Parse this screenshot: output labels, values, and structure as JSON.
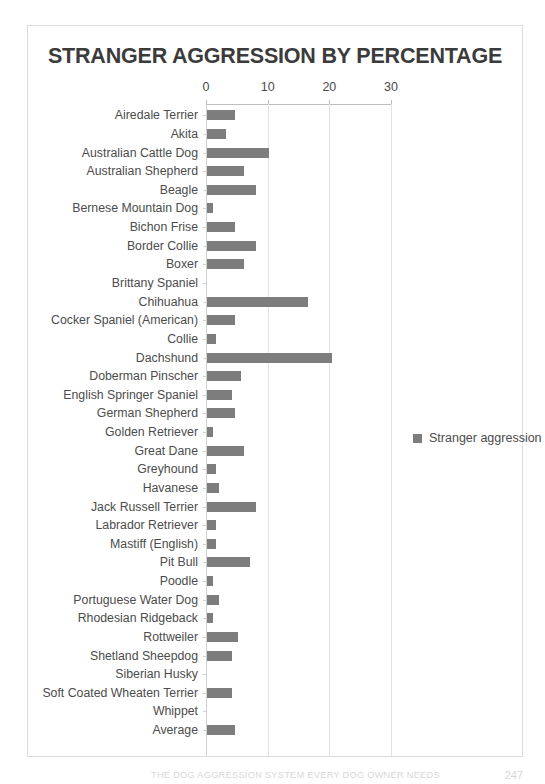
{
  "chart_data": {
    "type": "bar",
    "orientation": "horizontal",
    "title": "STRANGER AGGRESSION BY PERCENTAGE",
    "xlabel": "",
    "ylabel": "",
    "xlim": [
      0,
      30
    ],
    "xticks": [
      0,
      10,
      20,
      30
    ],
    "grid": true,
    "legend_position": "right",
    "series_name": "Stranger aggression",
    "bar_color": "#7d7d7d",
    "categories": [
      "Airedale Terrier",
      "Akita",
      "Australian Cattle Dog",
      "Australian Shepherd",
      "Beagle",
      "Bernese Mountain Dog",
      "Bichon Frise",
      "Border Collie",
      "Boxer",
      "Brittany Spaniel",
      "Chihuahua",
      "Cocker Spaniel (American)",
      "Collie",
      "Dachshund",
      "Doberman Pinscher",
      "English Springer Spaniel",
      "German Shepherd",
      "Golden Retriever",
      "Great Dane",
      "Greyhound",
      "Havanese",
      "Jack Russell Terrier",
      "Labrador Retriever",
      "Mastiff (English)",
      "Pit Bull",
      "Poodle",
      "Portuguese Water Dog",
      "Rhodesian Ridgeback",
      "Rottweiler",
      "Shetland Sheepdog",
      "Siberian Husky",
      "Soft Coated Wheaten Terrier",
      "Whippet",
      "Average"
    ],
    "values": [
      4.5,
      3.0,
      10.0,
      6.0,
      8.0,
      1.0,
      4.5,
      8.0,
      6.0,
      0.0,
      16.4,
      4.5,
      1.5,
      20.2,
      5.5,
      4.0,
      4.5,
      1.0,
      6.0,
      1.5,
      2.0,
      8.0,
      1.5,
      1.5,
      7.0,
      1.0,
      2.0,
      1.0,
      5.0,
      4.0,
      0.0,
      4.0,
      0.0,
      4.5
    ]
  },
  "legend": {
    "label": "Stranger aggression"
  },
  "footer": {
    "text": "THE DOG AGGRESSION SYSTEM EVERY DOG OWNER NEEDS",
    "page": "247"
  }
}
